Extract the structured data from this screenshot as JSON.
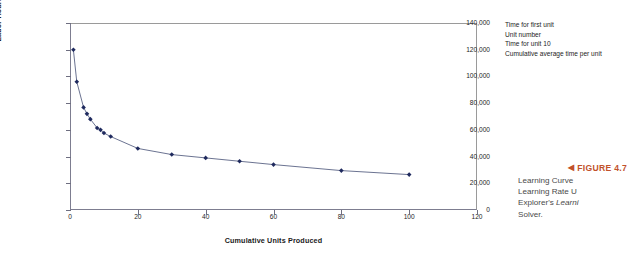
{
  "chart_data": {
    "type": "line",
    "title": "",
    "xlabel": "Cumulative Units Produced",
    "ylabel": "Labor Hours per Unit",
    "xlim": [
      0,
      120
    ],
    "ylim": [
      0,
      140000
    ],
    "xticks": [
      0,
      20,
      40,
      60,
      80,
      100,
      120
    ],
    "xtick_labels": [
      "0",
      "20",
      "40",
      "60",
      "80",
      "100",
      "120"
    ],
    "yticks": [
      0,
      20000,
      40000,
      60000,
      80000,
      100000,
      120000,
      140000
    ],
    "ytick_labels": [
      "0",
      "20,000",
      "40,000",
      "60,000",
      "80,000",
      "100,000",
      "120,000",
      "140,000"
    ],
    "grid": false,
    "legend": false,
    "marker": "diamond",
    "series_color": "#1f2a5e",
    "line_color": "#5a6384",
    "x": [
      1,
      2,
      4,
      5,
      6,
      8,
      9,
      10,
      12,
      20,
      30,
      40,
      50,
      60,
      80,
      100
    ],
    "y": [
      120000,
      96000,
      76800,
      72000,
      68000,
      61440,
      60000,
      57600,
      55000,
      46080,
      41500,
      39000,
      36500,
      34000,
      29500,
      26500
    ],
    "series": [
      {
        "name": "Cumulative average time per unit",
        "values": [
          120000,
          96000,
          76800,
          72000,
          68000,
          61440,
          60000,
          57600,
          55000,
          46080,
          41500,
          39000,
          36500,
          34000,
          29500,
          26500
        ]
      }
    ]
  },
  "annotations": {
    "lines": [
      "Time for first unit",
      "Unit number",
      "Time for unit 10",
      "Cumulative average time per unit"
    ]
  },
  "figure": {
    "arrow": "◀",
    "heading": "FIGURE 4.7",
    "caption_lines": [
      "Learning Curve",
      "Learning Rate U",
      "Explorer's ",
      "Solver."
    ],
    "caption_italic_fragment": "Learni",
    "accent_color": "#c1512a"
  }
}
